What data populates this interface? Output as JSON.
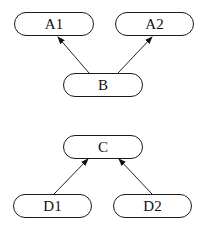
{
  "diagram": {
    "groups": [
      {
        "nodes": [
          {
            "id": "A1",
            "label": "A1",
            "x": 14,
            "y": 12,
            "w": 80,
            "h": 24
          },
          {
            "id": "A2",
            "label": "A2",
            "x": 115,
            "y": 12,
            "w": 79,
            "h": 24
          },
          {
            "id": "B",
            "label": "B",
            "x": 63,
            "y": 73,
            "w": 80,
            "h": 24
          }
        ],
        "edges": [
          {
            "from": "B",
            "to": "A1"
          },
          {
            "from": "B",
            "to": "A2"
          }
        ]
      },
      {
        "nodes": [
          {
            "id": "C",
            "label": "C",
            "x": 63,
            "y": 135,
            "w": 80,
            "h": 24
          },
          {
            "id": "D1",
            "label": "D1",
            "x": 13,
            "y": 194,
            "w": 79,
            "h": 24
          },
          {
            "id": "D2",
            "label": "D2",
            "x": 113,
            "y": 194,
            "w": 79,
            "h": 24
          }
        ],
        "edges": [
          {
            "from": "D1",
            "to": "C"
          },
          {
            "from": "D2",
            "to": "C"
          }
        ]
      }
    ]
  }
}
